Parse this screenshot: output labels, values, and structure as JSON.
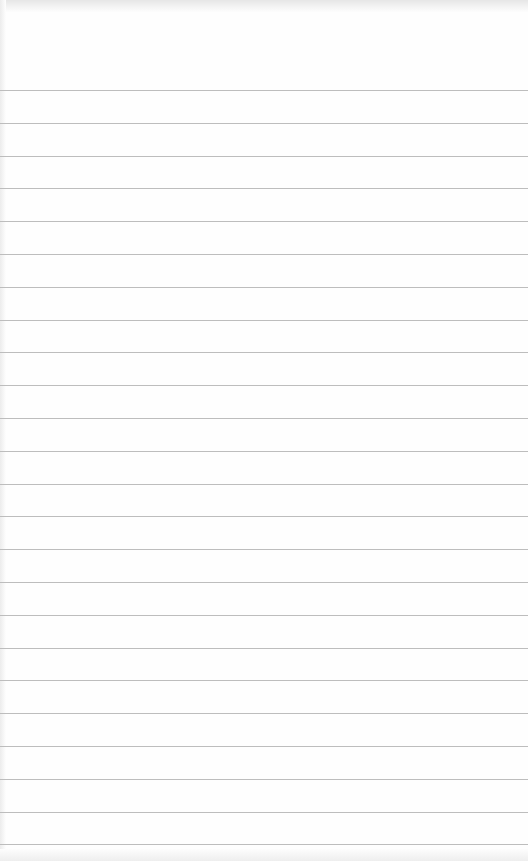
{
  "page": {
    "type": "ruled-notepad-sheet",
    "background_color": "#fefefe",
    "rule_color": "#bdbdbd",
    "first_rule_y": 90,
    "rule_spacing": 32.8,
    "rule_count": 24,
    "text": ""
  }
}
